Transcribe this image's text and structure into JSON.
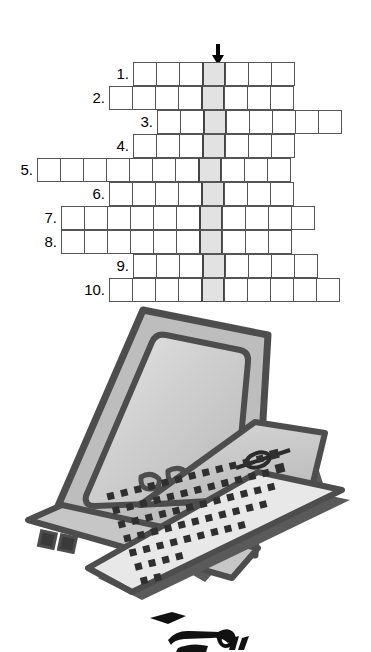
{
  "page": {
    "background_color": "#ffffff"
  },
  "puzzle": {
    "name": "numbered-crossword-grid",
    "arrow": {
      "icon": "arrow-down-icon",
      "label": "down-arrow-marker",
      "x": 211,
      "y": 44,
      "color": "#000000"
    },
    "cell_size": 24,
    "cell_border_color": "#555555",
    "shaded_cell_color": "#e2e2e2",
    "shaded_cell_border_color": "#444444",
    "solution_column_index_px": 205,
    "rows": [
      {
        "number": "1.",
        "label_x": 105,
        "start_x": 133,
        "y": 62,
        "cells": 7,
        "shaded_index": 3
      },
      {
        "number": "2.",
        "label_x": 81,
        "start_x": 109,
        "y": 86,
        "cells": 8,
        "shaded_index": 4
      },
      {
        "number": "3.",
        "label_x": 129,
        "start_x": 157,
        "y": 110,
        "cells": 8,
        "shaded_index": 2
      },
      {
        "number": "4.",
        "label_x": 105,
        "start_x": 133,
        "y": 134,
        "cells": 7,
        "shaded_index": 3
      },
      {
        "number": "5.",
        "label_x": 9,
        "start_x": 37,
        "y": 158,
        "cells": 11,
        "shaded_index": 7
      },
      {
        "number": "6.",
        "label_x": 81,
        "start_x": 109,
        "y": 182,
        "cells": 8,
        "shaded_index": 4
      },
      {
        "number": "7.",
        "label_x": 33,
        "start_x": 61,
        "y": 206,
        "cells": 11,
        "shaded_index": 6
      },
      {
        "number": "8.",
        "label_x": 33,
        "start_x": 61,
        "y": 230,
        "cells": 10,
        "shaded_index": 6
      },
      {
        "number": "9.",
        "label_x": 105,
        "start_x": 133,
        "y": 254,
        "cells": 8,
        "shaded_index": 3
      },
      {
        "number": "10.",
        "label_x": 73,
        "start_x": 109,
        "y": 278,
        "cells": 10,
        "shaded_index": 4
      }
    ]
  },
  "illustration": {
    "name": "desktop-computer-clipart",
    "description": "Tilted desktop computer with monitor, system unit and keyboard",
    "colors": {
      "outline": "#4d4d4d",
      "body_light": "#d0d0d0",
      "body_mid": "#bdbdbd",
      "screen": "#c9c9c9",
      "shadow": "#5a5a5a",
      "keys": "#3a3a3a",
      "keyboard_face": "#e8e8e8"
    }
  },
  "bottom_clip": {
    "name": "partial-clipart-bottom",
    "description": "Partially visible black-and-white clipart cut off by the page edge",
    "color": "#111111"
  }
}
